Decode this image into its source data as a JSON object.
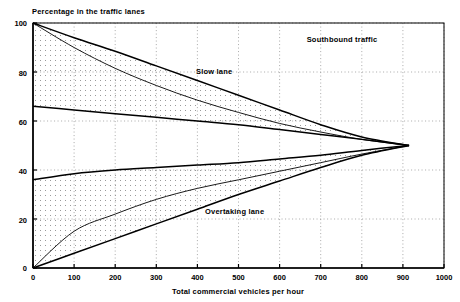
{
  "chart_data": {
    "type": "line",
    "title": "",
    "ylabel": "Percentage in the traffic lanes",
    "xlabel": "Total commercial vehicles per hour",
    "xlim": [
      0,
      1000
    ],
    "ylim": [
      0,
      100
    ],
    "xticks": [
      0,
      100,
      200,
      300,
      400,
      500,
      600,
      700,
      800,
      900,
      1000
    ],
    "yticks": [
      0,
      20,
      40,
      60,
      80,
      100
    ],
    "grid": "dotted",
    "legend_position": "inline-annotations",
    "annotations": [
      {
        "text": "Southbound traffic",
        "x": 700,
        "y": 92
      },
      {
        "text": "Slow lane",
        "x": 415,
        "y": 78
      },
      {
        "text": "Overtaking lane",
        "x": 430,
        "y": 22
      }
    ],
    "converge_point": {
      "x": 915,
      "y": 50
    },
    "series": [
      {
        "name": "Slow lane upper bound",
        "x": [
          0,
          100,
          200,
          300,
          400,
          500,
          600,
          700,
          800,
          915
        ],
        "values": [
          100,
          94,
          88.5,
          82.5,
          76.5,
          70.5,
          64.5,
          58.5,
          53.5,
          50
        ]
      },
      {
        "name": "Slow lane mean",
        "x": [
          0,
          100,
          200,
          300,
          400,
          500,
          600,
          700,
          800,
          915
        ],
        "values": [
          100,
          90,
          81.5,
          74.5,
          68.5,
          63.5,
          59,
          55.5,
          52.5,
          50
        ]
      },
      {
        "name": "Slow lane lower bound",
        "x": [
          0,
          100,
          200,
          300,
          400,
          500,
          600,
          700,
          800,
          915
        ],
        "values": [
          66,
          64.5,
          63,
          61.5,
          60,
          58.5,
          56.5,
          54.5,
          52.5,
          50
        ]
      },
      {
        "name": "Overtaking lane upper bound",
        "x": [
          0,
          100,
          200,
          300,
          400,
          500,
          600,
          700,
          800,
          915
        ],
        "values": [
          36,
          38.5,
          40,
          41,
          42,
          43,
          44.5,
          46,
          48,
          50
        ]
      },
      {
        "name": "Overtaking lane mean",
        "x": [
          0,
          100,
          200,
          300,
          400,
          500,
          600,
          700,
          800,
          915
        ],
        "values": [
          0,
          15,
          22,
          28,
          32.5,
          36,
          39.5,
          43,
          46.5,
          50
        ]
      },
      {
        "name": "Overtaking lane lower bound",
        "x": [
          0,
          100,
          200,
          300,
          400,
          500,
          600,
          700,
          800,
          915
        ],
        "values": [
          0,
          6,
          12,
          18,
          24,
          30,
          35.5,
          41,
          46,
          50
        ]
      }
    ],
    "bands": [
      {
        "name": "slow-lane-band",
        "upper": "Slow lane upper bound",
        "lower": "Slow lane lower bound",
        "fill": "#d9d9d9"
      },
      {
        "name": "overtaking-lane-band",
        "upper": "Overtaking lane upper bound",
        "lower": "Overtaking lane lower bound",
        "fill": "#d9d9d9"
      }
    ],
    "colors": {
      "line": "#000000",
      "band": "#dcdcdc",
      "grid": "#999999",
      "axis": "#000000"
    }
  },
  "labels": {
    "y_axis_title": "Percentage in the traffic lanes",
    "x_axis_title": "Total commercial vehicles per hour",
    "southbound": "Southbound traffic",
    "slow_lane": "Slow lane",
    "overtaking_lane": "Overtaking lane",
    "xt0": "0",
    "xt1": "100",
    "xt2": "200",
    "xt3": "300",
    "xt4": "400",
    "xt5": "500",
    "xt6": "600",
    "xt7": "700",
    "xt8": "800",
    "xt9": "900",
    "xt10": "1000",
    "yt0": "0",
    "yt1": "20",
    "yt2": "40",
    "yt3": "60",
    "yt4": "80",
    "yt5": "100"
  }
}
